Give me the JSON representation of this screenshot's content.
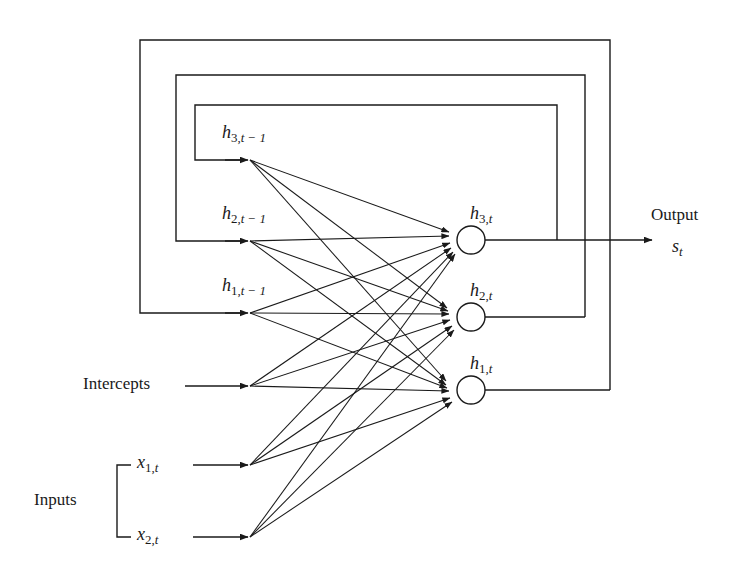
{
  "figure": {
    "type": "diagram",
    "subtype": "recurrent-neural-network-architecture",
    "background_color": "#ffffff",
    "stroke_color": "#1a1a1a"
  },
  "labels": {
    "output_title": "Output",
    "output_symbol_base": "s",
    "output_symbol_sub": "t",
    "intercepts": "Intercepts",
    "inputs": "Inputs"
  },
  "recurrent_inputs": [
    {
      "id": "h3-prev",
      "base": "h",
      "sub_index": "3,",
      "sub_time": "t − 1",
      "label": "h3,t-1",
      "x": 248,
      "y": 160
    },
    {
      "id": "h2-prev",
      "base": "h",
      "sub_index": "2,",
      "sub_time": "t − 1",
      "label": "h2,t-1",
      "x": 248,
      "y": 241
    },
    {
      "id": "h1-prev",
      "base": "h",
      "sub_index": "1,",
      "sub_time": "t − 1",
      "label": "h1,t-1",
      "x": 248,
      "y": 313
    }
  ],
  "external_inputs": [
    {
      "id": "intercepts",
      "label": "Intercepts",
      "kind": "text",
      "x": 248,
      "y": 386
    },
    {
      "id": "x1",
      "base": "x",
      "sub_index": "1,",
      "sub_time": "t",
      "label": "x1,t",
      "kind": "math",
      "x": 248,
      "y": 465
    },
    {
      "id": "x2",
      "base": "x",
      "sub_index": "2,",
      "sub_time": "t",
      "label": "x2,t",
      "kind": "math",
      "x": 248,
      "y": 537
    }
  ],
  "hidden_nodes": [
    {
      "id": "h3",
      "base": "h",
      "sub_index": "3,",
      "sub_time": "t",
      "label": "h3,t",
      "cx": 471,
      "cy": 240,
      "r": 14,
      "feedback_x": 557
    },
    {
      "id": "h2",
      "base": "h",
      "sub_index": "2,",
      "sub_time": "t",
      "label": "h2,t",
      "cx": 471,
      "cy": 317,
      "r": 14,
      "feedback_x": 585
    },
    {
      "id": "h1",
      "base": "h",
      "sub_index": "1,",
      "sub_time": "t",
      "label": "h1,t",
      "cx": 471,
      "cy": 390,
      "r": 14,
      "feedback_x": 610
    }
  ],
  "feedback_rectangles": [
    {
      "id": "inner-loop",
      "left": 195,
      "top": 105,
      "right": 557,
      "bottom": 160,
      "source": "h3",
      "target": "h3-prev"
    },
    {
      "id": "middle-loop",
      "left": 176,
      "top": 75,
      "right": 585,
      "bottom": 241,
      "source": "h2",
      "target": "h2-prev"
    },
    {
      "id": "outer-loop",
      "left": 140,
      "top": 40,
      "right": 610,
      "bottom": 313,
      "source": "h1",
      "target": "h1-prev"
    }
  ],
  "output_arrow": {
    "from_x": 485,
    "to_x": 652,
    "y": 240
  },
  "inputs_bracket": {
    "x": 117,
    "top": 465,
    "bottom": 537,
    "tick": 14
  },
  "connection_count": 18,
  "connections_note": "Every one of the 6 source terminals connects to each of the 3 hidden nodes."
}
